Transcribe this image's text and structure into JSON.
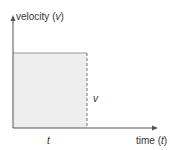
{
  "diagram": {
    "y_axis_label": "velocity",
    "y_axis_var": "v",
    "x_axis_label": "time",
    "x_axis_var": "t",
    "area_height_label": "v",
    "area_width_label": "t",
    "colors": {
      "axis": "#555555",
      "fill": "#eeeeee",
      "edge": "#888888",
      "text": "#333333"
    }
  }
}
